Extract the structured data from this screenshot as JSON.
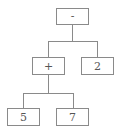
{
  "diagram": {
    "type": "expression-tree",
    "nodes": {
      "root": {
        "label": "-"
      },
      "plus": {
        "label": "+"
      },
      "two": {
        "label": "2"
      },
      "five": {
        "label": "5"
      },
      "seven": {
        "label": "7"
      }
    },
    "edges": [
      [
        "-",
        "+"
      ],
      [
        "-",
        "2"
      ],
      [
        "+",
        "5"
      ],
      [
        "+",
        "7"
      ]
    ]
  }
}
